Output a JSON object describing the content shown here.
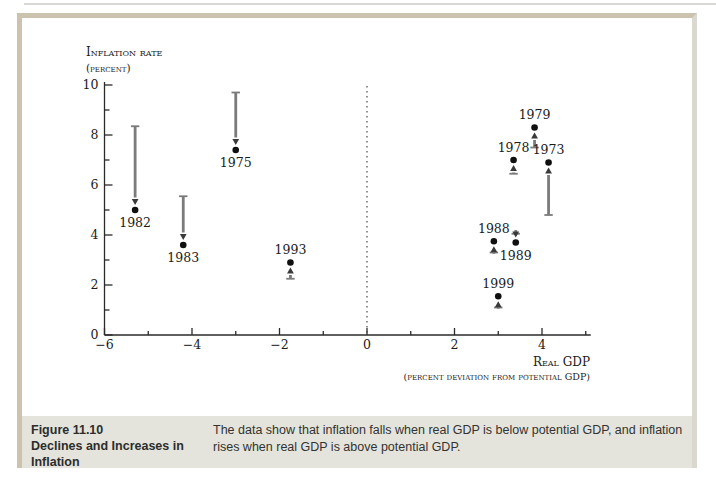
{
  "page": {
    "figure_label": "Figure 11.10",
    "figure_title": "Declines and Increases in Inflation",
    "caption_text": "The data show that inflation falls when real GDP is below potential GDP, and inflation rises when real GDP is above potential GDP."
  },
  "colors": {
    "frame_border": "#cbc3ae",
    "frame_border_right": "#dad8cf",
    "caption_bg": "#e4e4dd",
    "axis": "#2a2a2a",
    "dashed_line": "#3a3a3a",
    "arrow_shaft": "#7b7b7b",
    "arrow_head": "#3a3a3a",
    "dot": "#101010",
    "chart_text": "#1b1b1b"
  },
  "chart_data": {
    "type": "scatter",
    "title": "",
    "ylabel_line1": "Inflation rate",
    "ylabel_line2": "(percent)",
    "xlabel_line1": "Real GDP",
    "xlabel_line2": "(percent deviation from potential GDP)",
    "xlim": [
      -6,
      5
    ],
    "ylim": [
      0,
      10
    ],
    "x_major_ticks": [
      -6,
      -4,
      -2,
      0,
      2,
      4
    ],
    "x_major_labels": [
      "−6",
      "−4",
      "−2",
      "0",
      "2",
      "4"
    ],
    "x_minor_ticks": [
      -5,
      -3,
      -1,
      1,
      3,
      5
    ],
    "y_major_ticks": [
      0,
      2,
      4,
      6,
      8,
      10
    ],
    "y_major_labels": [
      "0",
      "2",
      "4",
      "6",
      "8",
      "10"
    ],
    "y_minor_ticks": [
      1,
      3,
      5,
      7,
      9
    ],
    "zero_gap_line_x": 0,
    "points": [
      {
        "year": "1982",
        "gdp_gap": -5.3,
        "inflation": 5.0,
        "arrow_from": 8.35,
        "label_pos": "below"
      },
      {
        "year": "1983",
        "gdp_gap": -4.2,
        "inflation": 3.6,
        "arrow_from": 5.55,
        "label_pos": "below"
      },
      {
        "year": "1975",
        "gdp_gap": -3.0,
        "inflation": 7.4,
        "arrow_from": 9.7,
        "label_pos": "below"
      },
      {
        "year": "1993",
        "gdp_gap": -1.75,
        "inflation": 2.9,
        "arrow_from": 2.25,
        "label_pos": "above"
      },
      {
        "year": "1999",
        "gdp_gap": 3.0,
        "inflation": 1.55,
        "arrow_from": 1.1,
        "label_pos": "above"
      },
      {
        "year": "1988",
        "gdp_gap": 2.9,
        "inflation": 3.75,
        "arrow_from": 3.3,
        "label_pos": "above"
      },
      {
        "year": "1989",
        "gdp_gap": 3.4,
        "inflation": 3.7,
        "arrow_from": 4.05,
        "label_pos": "below"
      },
      {
        "year": "1978",
        "gdp_gap": 3.35,
        "inflation": 7.0,
        "arrow_from": 6.45,
        "label_pos": "above"
      },
      {
        "year": "1979",
        "gdp_gap": 3.83,
        "inflation": 8.3,
        "arrow_from": 7.5,
        "label_pos": "above"
      },
      {
        "year": "1973",
        "gdp_gap": 4.15,
        "inflation": 6.9,
        "arrow_from": 4.8,
        "label_pos": "above"
      }
    ]
  }
}
